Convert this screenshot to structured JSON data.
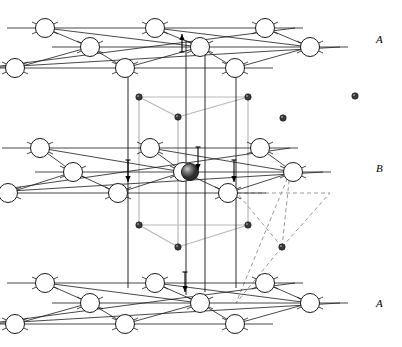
{
  "figure": {
    "type": "crystal-structure-diagram"
  },
  "labels": [
    {
      "id": "layer-a-top",
      "text": "A",
      "x": 378,
      "y": 33
    },
    {
      "id": "layer-b-mid",
      "text": "B",
      "x": 378,
      "y": 162
    },
    {
      "id": "layer-a-bottom",
      "text": "A",
      "x": 378,
      "y": 297
    }
  ],
  "colors": {
    "host_stroke": "#1a1a1a",
    "host_fill": "#ffffff",
    "interstitial_fill": "#3a3a3a",
    "prism_line": "#2a2a2a",
    "gray_guide": "#b9b9b9",
    "dashed_guide": "#9a9a9a",
    "center_atom": "#555555",
    "background": "#ffffff"
  },
  "geometry": {
    "circle_r": 9.5,
    "dot_r": 3.2,
    "bond_stub": 13,
    "row_dx": 110,
    "layer_a_top_y": 28,
    "layer_b_y": 166,
    "layer_a_bot_y": 300
  },
  "layers": [
    {
      "name": "A",
      "position": "top",
      "rows": [
        {
          "y": 28,
          "x0": 45,
          "count": 3,
          "dx": 110
        },
        {
          "y": 47,
          "x0": 90,
          "count": 3,
          "dx": 110
        },
        {
          "y": 68,
          "x0": 15,
          "count": 3,
          "dx": 110
        }
      ]
    },
    {
      "name": "B",
      "position": "middle",
      "rows": [
        {
          "y": 148,
          "x0": 40,
          "count": 3,
          "dx": 110
        },
        {
          "y": 172,
          "x0": 73,
          "count": 3,
          "dx": 110
        },
        {
          "y": 193,
          "x0": 8,
          "count": 3,
          "dx": 110
        }
      ],
      "center_atom": {
        "x": 190,
        "y": 172,
        "r": 8.5,
        "shaded": true
      }
    },
    {
      "name": "A",
      "position": "bottom",
      "rows": [
        {
          "y": 283,
          "x0": 45,
          "count": 3,
          "dx": 110
        },
        {
          "y": 303,
          "x0": 90,
          "count": 3,
          "dx": 110
        },
        {
          "y": 324,
          "x0": 15,
          "count": 3,
          "dx": 110
        }
      ]
    }
  ],
  "interstitials": {
    "upper_triangle": [
      {
        "x": 139,
        "y": 97
      },
      {
        "x": 248,
        "y": 97
      },
      {
        "x": 178,
        "y": 117
      }
    ],
    "lower_triangle": [
      {
        "x": 139,
        "y": 225
      },
      {
        "x": 248,
        "y": 225
      },
      {
        "x": 178,
        "y": 247
      }
    ],
    "isolated": [
      {
        "x": 283,
        "y": 118
      },
      {
        "x": 355,
        "y": 96
      }
    ],
    "tetra_center": [
      {
        "x": 282,
        "y": 247
      }
    ]
  },
  "prism_vertical_lines": [
    {
      "x": 128,
      "y1": 75,
      "y2": 288
    },
    {
      "x": 186,
      "y1": 40,
      "y2": 295
    },
    {
      "x": 205,
      "y1": 40,
      "y2": 292
    },
    {
      "x": 236,
      "y1": 75,
      "y2": 288
    }
  ],
  "arrows": [
    {
      "id": "arrow-up-top",
      "x": 182,
      "y1": 52,
      "y2": 34,
      "dir": "up"
    },
    {
      "id": "arrow-down-left",
      "x": 128,
      "y1": 160,
      "y2": 182,
      "dir": "down"
    },
    {
      "id": "arrow-down-center",
      "x": 198,
      "y1": 147,
      "y2": 170,
      "dir": "down"
    },
    {
      "id": "arrow-down-right",
      "x": 234,
      "y1": 160,
      "y2": 182,
      "dir": "down"
    },
    {
      "id": "arrow-down-bottom",
      "x": 185,
      "y1": 272,
      "y2": 292,
      "dir": "down"
    }
  ],
  "dashed_tetrahedron": {
    "apex": {
      "x": 282,
      "y": 247
    },
    "vertices": [
      {
        "x": 237,
        "y": 193
      },
      {
        "x": 290,
        "y": 172
      },
      {
        "x": 330,
        "y": 193
      },
      {
        "x": 236,
        "y": 303
      }
    ]
  }
}
